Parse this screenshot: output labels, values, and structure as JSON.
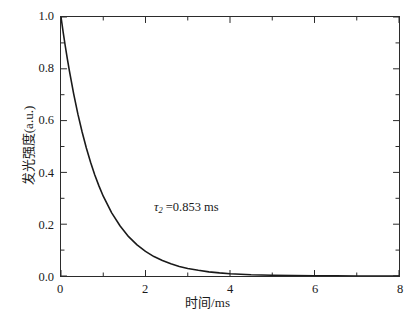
{
  "chart_data": {
    "type": "line",
    "title": "",
    "subtitle": "",
    "xlabel": "时间/ms",
    "ylabel": "发光强度(a.u.)",
    "xlim": [
      0,
      8
    ],
    "ylim": [
      0.0,
      1.0
    ],
    "grid": false,
    "legend": null,
    "legend_position": "none",
    "x_ticks": [
      0,
      2,
      4,
      6,
      8
    ],
    "x_tick_labels": [
      "0",
      "2",
      "4",
      "6",
      "8"
    ],
    "x_minor_ticks": [
      1,
      3,
      5,
      7
    ],
    "y_ticks": [
      0.0,
      0.2,
      0.4,
      0.6,
      0.8,
      1.0
    ],
    "y_tick_labels": [
      "0.0",
      "0.2",
      "0.4",
      "0.6",
      "0.8",
      "1.0"
    ],
    "y_minor_ticks": [
      0.1,
      0.3,
      0.5,
      0.7,
      0.9
    ],
    "tick_direction": "in",
    "line_color": "#1a1a1a",
    "line_width": 1.6,
    "annotations": [
      {
        "name": "lifetime-annotation",
        "symbol": "τ",
        "subscript": "2",
        "text": "τ2 =0.853 ms",
        "equals_value": "=0.853 ms",
        "value": 0.853,
        "unit": "ms",
        "x": 3.2,
        "y": 0.27
      }
    ],
    "series": [
      {
        "name": "luminescence decay",
        "model": "single exponential",
        "tau": 0.853,
        "x": [
          0.0,
          0.05,
          0.1,
          0.15,
          0.2,
          0.3,
          0.4,
          0.5,
          0.6,
          0.7,
          0.8,
          0.9,
          1.0,
          1.2,
          1.4,
          1.6,
          1.8,
          2.0,
          2.2,
          2.4,
          2.6,
          2.8,
          3.0,
          3.25,
          3.5,
          3.75,
          4.0,
          4.5,
          5.0,
          5.5,
          6.0,
          6.5,
          7.0,
          7.5,
          8.0
        ],
        "values": [
          1.0,
          0.943,
          0.889,
          0.838,
          0.791,
          0.703,
          0.625,
          0.556,
          0.494,
          0.439,
          0.39,
          0.347,
          0.308,
          0.244,
          0.193,
          0.152,
          0.12,
          0.095,
          0.075,
          0.06,
          0.047,
          0.037,
          0.029,
          0.022,
          0.016,
          0.012,
          0.009,
          0.005,
          0.003,
          0.002,
          0.001,
          0.001,
          0.0,
          0.0,
          0.0
        ]
      }
    ]
  },
  "axis": {
    "x_label": "时间/ms",
    "y_label": "发光强度(a.u.)"
  },
  "caption": {
    "text": ""
  }
}
